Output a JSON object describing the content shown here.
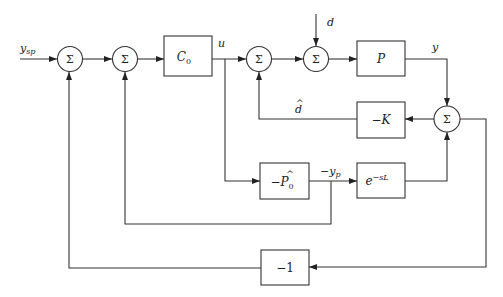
{
  "diagram": {
    "type": "block-diagram",
    "signals": {
      "setpoint": "y_sp",
      "control": "u",
      "disturbance": "d",
      "output": "y",
      "disturbance_estimate": "d̂",
      "prediction": "−y_p"
    },
    "blocks": {
      "controller": "C₀",
      "plant": "P",
      "gain": "−K",
      "model": "−P̂₀",
      "delay": "e^(−sL)",
      "unity": "−1"
    },
    "sum_symbol": "Σ",
    "sums": [
      {
        "id": "sum1",
        "label": "Σ"
      },
      {
        "id": "sum2",
        "label": "Σ"
      },
      {
        "id": "sum3",
        "label": "Σ"
      },
      {
        "id": "sum4",
        "label": "Σ"
      },
      {
        "id": "sum5",
        "label": "Σ"
      }
    ]
  },
  "labels": {
    "ysp_main": "y",
    "ysp_sub": "sp",
    "u": "u",
    "d": "d",
    "y": "y",
    "dhat": "d",
    "dhat_accent": "^",
    "yp_minus": "−y",
    "yp_sub": "p",
    "c0_main": "C",
    "c0_sub": "0",
    "p": "P",
    "k": "−K",
    "p0_minus": "−",
    "p0_main": "P",
    "p0_hat": "^",
    "p0_sub": "0",
    "delay_base": "e",
    "delay_exp": "−sL",
    "neg_one": "−1"
  }
}
